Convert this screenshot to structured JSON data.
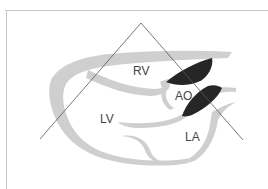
{
  "diagram": {
    "type": "echocardiography parasternal long-axis view schematic",
    "labels": {
      "rv": "RV",
      "lv": "LV",
      "ao": "AO",
      "la": "LA"
    },
    "colors": {
      "background": "#ffffff",
      "myocardium": "#cfcfcf",
      "valve_leaflets": "#262626",
      "scan_sector_lines": "#555555",
      "label_text": "#444444",
      "frame": "#c8c8c8"
    }
  }
}
